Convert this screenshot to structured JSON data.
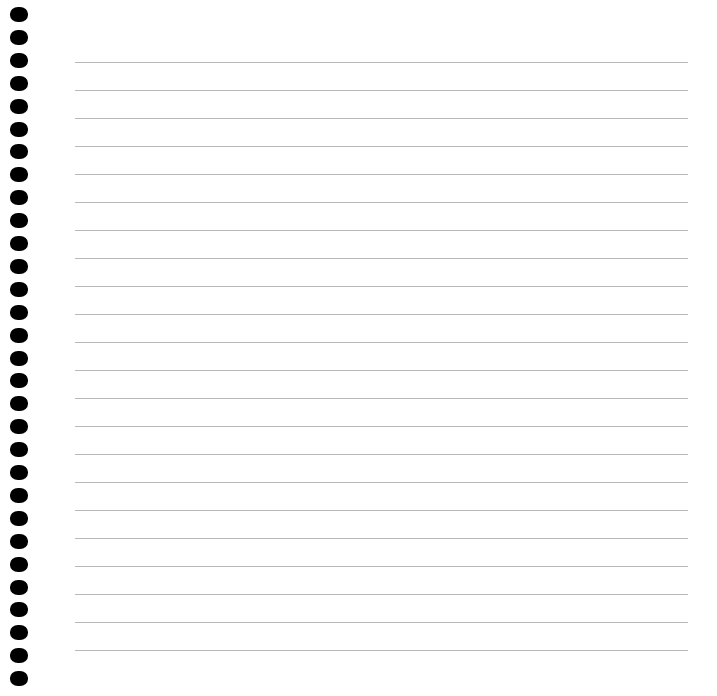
{
  "page": {
    "type": "blank lined notebook page",
    "background_color": "#ffffff",
    "binding": {
      "style": "spiral holes",
      "hole_count": 30,
      "hole_color": "#000000",
      "first_hole_y": 7,
      "hole_spacing": 22.9
    },
    "ruling": {
      "line_count": 22,
      "line_color": "#b8b8b8",
      "first_line_y": 62,
      "line_spacing": 28,
      "left": 75,
      "right": 688
    }
  }
}
